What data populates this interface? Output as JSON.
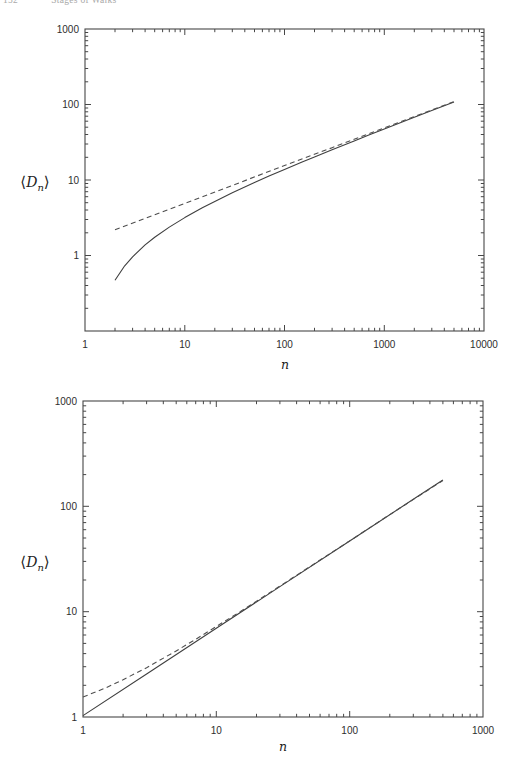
{
  "header": {
    "page_number": "152",
    "title": "Stages of Walks"
  },
  "colors": {
    "ink": "#474747",
    "curve_solid": "#3f3f3f",
    "curve_dashed": "#4f4f4f",
    "paper": "#ffffff",
    "header_text": "#a9a9a9"
  },
  "chart_data": [
    {
      "type": "line",
      "title": "",
      "xlabel": "n",
      "ylabel": "<Dn>",
      "ylabel_parts": {
        "open": "⟨",
        "letter": "D",
        "sub": "n",
        "close": "⟩"
      },
      "xscale": "log",
      "yscale": "log",
      "xlim": [
        1,
        10000
      ],
      "ylim": [
        0.1,
        1000
      ],
      "x_ticks": [
        1,
        10,
        100,
        1000,
        10000
      ],
      "x_tick_labels": [
        "1",
        "10",
        "100",
        "1000",
        "10000"
      ],
      "y_ticks": [
        1000,
        100,
        10,
        1
      ],
      "y_tick_labels": [
        "1000",
        "100",
        "10",
        "1"
      ],
      "grid": false,
      "legend": null,
      "series": [
        {
          "name": "mean-displacement-solid-curve",
          "style": "solid",
          "points": [
            [
              2,
              0.47
            ],
            [
              2.5,
              0.73
            ],
            [
              3,
              0.96
            ],
            [
              4,
              1.38
            ],
            [
              5,
              1.75
            ],
            [
              7,
              2.38
            ],
            [
              10,
              3.18
            ],
            [
              15,
              4.28
            ],
            [
              20,
              5.21
            ],
            [
              30,
              6.77
            ],
            [
              50,
              9.24
            ],
            [
              70,
              11.25
            ],
            [
              100,
              13.8
            ],
            [
              150,
              17.3
            ],
            [
              200,
              20.2
            ],
            [
              300,
              25.1
            ],
            [
              500,
              32.9
            ],
            [
              700,
              39.3
            ],
            [
              1000,
              47.3
            ],
            [
              2000,
              67.6
            ],
            [
              3000,
              83.2
            ],
            [
              5000,
              107.9
            ]
          ]
        },
        {
          "name": "sqrt-asymptote-dashed-line",
          "style": "dashed",
          "points": [
            [
              2,
              2.19
            ],
            [
              5,
              3.47
            ],
            [
              10,
              4.9
            ],
            [
              30,
              8.49
            ],
            [
              100,
              15.5
            ],
            [
              300,
              26.8
            ],
            [
              1000,
              49.0
            ],
            [
              3000,
              84.9
            ],
            [
              5000,
              109.6
            ]
          ]
        }
      ]
    },
    {
      "type": "line",
      "title": "",
      "xlabel": "n",
      "ylabel": "<Dn>",
      "ylabel_parts": {
        "open": "⟨",
        "letter": "D",
        "sub": "n",
        "close": "⟩"
      },
      "xscale": "log",
      "yscale": "log",
      "xlim": [
        1,
        1000
      ],
      "ylim": [
        1,
        1000
      ],
      "x_ticks": [
        1,
        10,
        100,
        1000
      ],
      "x_tick_labels": [
        "1",
        "10",
        "100",
        "1000"
      ],
      "y_ticks": [
        1000,
        100,
        10,
        1
      ],
      "y_tick_labels": [
        "1000",
        "100",
        "10",
        "1"
      ],
      "grid": false,
      "legend": null,
      "series": [
        {
          "name": "mean-displacement-solid-line",
          "style": "solid",
          "points": [
            [
              1,
              1.03
            ],
            [
              3,
              2.56
            ],
            [
              10,
              6.95
            ],
            [
              30,
              17.3
            ],
            [
              100,
              46.9
            ],
            [
              300,
              116.5
            ],
            [
              500,
              178
            ]
          ]
        },
        {
          "name": "asymptote-dashed-curve",
          "style": "dashed",
          "points": [
            [
              1,
              1.55
            ],
            [
              1.5,
              1.9
            ],
            [
              2,
              2.26
            ],
            [
              3,
              2.94
            ],
            [
              5,
              4.24
            ],
            [
              7,
              5.47
            ],
            [
              10,
              7.23
            ],
            [
              15,
              9.96
            ],
            [
              20,
              12.57
            ],
            [
              30,
              17.5
            ],
            [
              50,
              26.6
            ],
            [
              100,
              47.0
            ],
            [
              200,
              83.4
            ],
            [
              500,
              176
            ]
          ]
        }
      ]
    }
  ]
}
